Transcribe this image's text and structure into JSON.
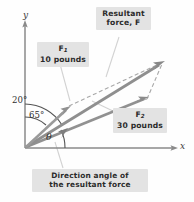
{
  "figure": {
    "title_callouts": {
      "resultant": {
        "line1": "Resultant",
        "line2": "force, F"
      },
      "f1": {
        "line1": "F",
        "sub1": "1",
        "line2": "10 pounds"
      },
      "f2": {
        "line1": "F",
        "sub1": "2",
        "line2": "30 pounds"
      },
      "direction": {
        "line1": "Direction angle of",
        "line2": "the resultant force"
      }
    },
    "axes": {
      "y_label": "y",
      "x_label": "x"
    },
    "angles": {
      "upper": "20°",
      "middle": "65°",
      "theta": "θ"
    },
    "colors": {
      "callout_background": "#e3e3e3",
      "callout_text": "#2b2b2b",
      "vector": "#8c8c8c",
      "axis": "#8a8a8a",
      "dashed": "#a8a8a8",
      "leader": "#cfcfcf",
      "background": "#fefefe"
    },
    "geometry": {
      "origin": [
        25,
        148
      ],
      "y_axis_top": [
        25,
        22
      ],
      "x_axis_right": [
        176,
        148
      ],
      "f1_tip": [
        74,
        104
      ],
      "f2_tip": [
        148,
        98
      ],
      "resultant_tip": [
        164,
        62
      ]
    }
  }
}
